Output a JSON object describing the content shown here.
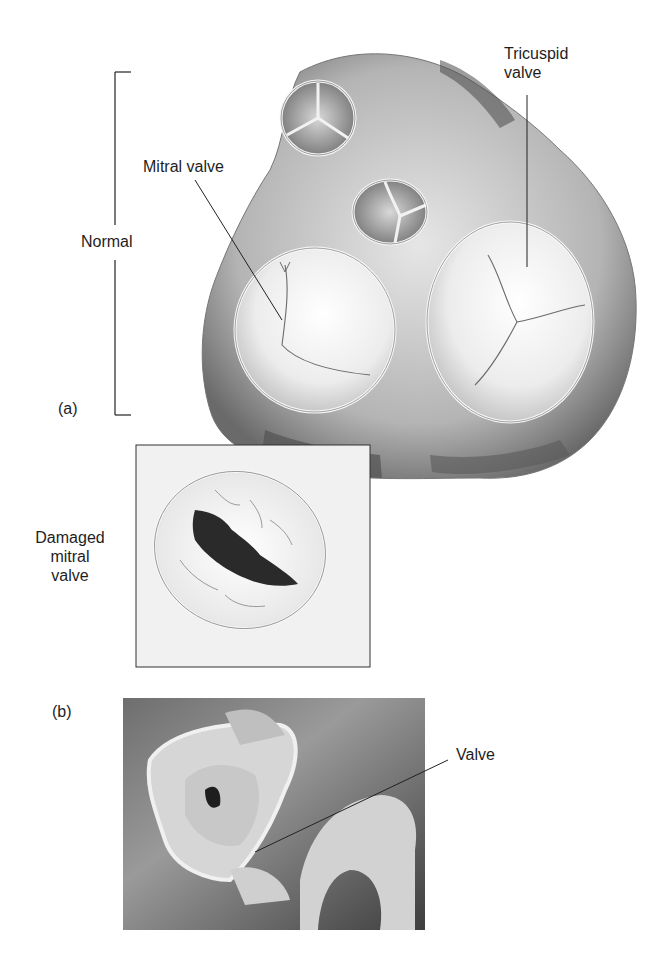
{
  "figure": {
    "panel_a": {
      "letter": "(a)",
      "bracket_label": "Normal",
      "labels": {
        "mitral": "Mitral valve",
        "tricuspid_line1": "Tricuspid",
        "tricuspid_line2": "valve"
      },
      "inset": {
        "label_line1": "Damaged",
        "label_line2": "mitral",
        "label_line3": "valve"
      }
    },
    "panel_b": {
      "letter": "(b)",
      "labels": {
        "valve": "Valve"
      }
    }
  }
}
